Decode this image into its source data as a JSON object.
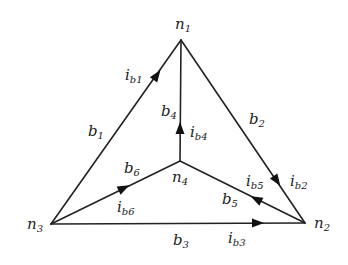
{
  "diagram": {
    "type": "directed graph (circuit topology)",
    "nodes": [
      {
        "id": "n1",
        "base": "n",
        "sub": "1",
        "x": 181,
        "y": 40
      },
      {
        "id": "n2",
        "base": "n",
        "sub": "2",
        "x": 305,
        "y": 223
      },
      {
        "id": "n3",
        "base": "n",
        "sub": "3",
        "x": 51,
        "y": 224
      },
      {
        "id": "n4",
        "base": "n",
        "sub": "4",
        "x": 180,
        "y": 161
      }
    ],
    "branches": [
      {
        "id": "b1",
        "from": "n3",
        "to": "n1",
        "current": "ib1"
      },
      {
        "id": "b2",
        "from": "n1",
        "to": "n2",
        "current": "ib2"
      },
      {
        "id": "b3",
        "from": "n3",
        "to": "n2",
        "current": "ib3"
      },
      {
        "id": "b4",
        "from": "n4",
        "to": "n1",
        "current": "ib4"
      },
      {
        "id": "b5",
        "from": "n2",
        "to": "n4",
        "current": "ib5"
      },
      {
        "id": "b6",
        "from": "n3",
        "to": "n4",
        "current": "ib6"
      }
    ]
  },
  "labels": {
    "n1": {
      "base": "n",
      "sub": "1"
    },
    "n2": {
      "base": "n",
      "sub": "2"
    },
    "n3": {
      "base": "n",
      "sub": "3"
    },
    "n4": {
      "base": "n",
      "sub": "4"
    },
    "b1": {
      "base": "b",
      "sub": "1"
    },
    "b2": {
      "base": "b",
      "sub": "2"
    },
    "b3": {
      "base": "b",
      "sub": "3"
    },
    "b4": {
      "base": "b",
      "sub": "4"
    },
    "b5": {
      "base": "b",
      "sub": "5"
    },
    "b6": {
      "base": "b",
      "sub": "6"
    },
    "ib1": {
      "base": "i",
      "sub": "b1"
    },
    "ib2": {
      "base": "i",
      "sub": "b2"
    },
    "ib3": {
      "base": "i",
      "sub": "b3"
    },
    "ib4": {
      "base": "i",
      "sub": "b4"
    },
    "ib5": {
      "base": "i",
      "sub": "b5"
    },
    "ib6": {
      "base": "i",
      "sub": "b6"
    }
  }
}
